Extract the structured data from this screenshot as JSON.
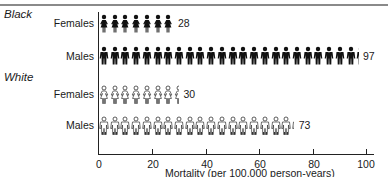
{
  "chart_data": {
    "type": "bar",
    "subtype": "pictograph",
    "title": "",
    "xlabel": "Mortality (per 100,000 person-years)",
    "ylabel": "",
    "xlim": [
      0,
      100
    ],
    "xticks": [
      0,
      20,
      40,
      60,
      80,
      100
    ],
    "units_per_icon": 4,
    "grid": false,
    "legend": null,
    "groups": [
      {
        "name": "Black",
        "rows": [
          {
            "name": "Females",
            "value": 28,
            "icon": "female-filled"
          },
          {
            "name": "Males",
            "value": 97,
            "icon": "male-filled"
          }
        ]
      },
      {
        "name": "White",
        "rows": [
          {
            "name": "Females",
            "value": 30,
            "icon": "female-outline"
          },
          {
            "name": "Males",
            "value": 73,
            "icon": "male-outline"
          }
        ]
      }
    ],
    "categories": [
      "Black Females",
      "Black Males",
      "White Females",
      "White Males"
    ],
    "values": [
      28,
      97,
      30,
      73
    ]
  },
  "labels": {
    "group_black": "Black",
    "group_white": "White",
    "black_females": "Females",
    "black_males": "Males",
    "white_females": "Females",
    "white_males": "Males",
    "val_black_females": "28",
    "val_black_males": "97",
    "val_white_females": "30",
    "val_white_males": "73",
    "tick_0": "0",
    "tick_20": "20",
    "tick_40": "40",
    "tick_60": "60",
    "tick_80": "80",
    "tick_100": "100",
    "xlabel": "Mortality (per 100,000 person-years)"
  }
}
